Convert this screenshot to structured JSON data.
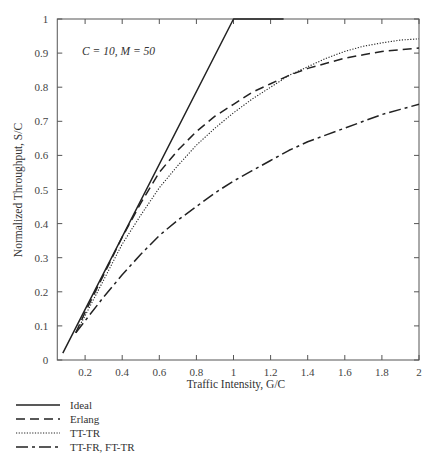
{
  "chart_data": {
    "type": "line",
    "title": "",
    "annotation": "C = 10, M = 50",
    "xlabel": "Traffic Intensity, G/C",
    "ylabel": "Normalized Throughput, S/C",
    "xlim": [
      0.05,
      2
    ],
    "ylim": [
      0,
      1
    ],
    "xticks": [
      0.2,
      0.4,
      0.6,
      0.8,
      1,
      1.2,
      1.4,
      1.6,
      1.8,
      2
    ],
    "xtick_labels": [
      "0.2",
      "0.4",
      "0.6",
      "0.8",
      "1",
      "1.2",
      "1.4",
      "1.6",
      "1.8",
      "2"
    ],
    "yticks": [
      0,
      0.1,
      0.2,
      0.3,
      0.4,
      0.5,
      0.6,
      0.7,
      0.8,
      0.9,
      1
    ],
    "ytick_labels": [
      "0",
      "0.1",
      "0.2",
      "0.3",
      "0.4",
      "0.5",
      "0.6",
      "0.7",
      "0.8",
      "0.9",
      "1"
    ],
    "grid": false,
    "legend_position": "below-left",
    "series": [
      {
        "name": "Ideal",
        "style": "solid",
        "x": [
          0.08,
          1.0,
          1.27
        ],
        "y": [
          0.02,
          1.0,
          1.0
        ]
      },
      {
        "name": "Erlang",
        "style": "dashed",
        "x": [
          0.15,
          0.2,
          0.3,
          0.4,
          0.5,
          0.6,
          0.7,
          0.8,
          0.9,
          1.0,
          1.1,
          1.2,
          1.3,
          1.4,
          1.5,
          1.6,
          1.7,
          1.8,
          1.9,
          2.0
        ],
        "y": [
          0.08,
          0.14,
          0.25,
          0.36,
          0.46,
          0.55,
          0.615,
          0.67,
          0.715,
          0.75,
          0.785,
          0.81,
          0.835,
          0.855,
          0.87,
          0.885,
          0.895,
          0.905,
          0.91,
          0.915
        ]
      },
      {
        "name": "TT-TR",
        "style": "dotted",
        "x": [
          0.15,
          0.2,
          0.3,
          0.4,
          0.5,
          0.6,
          0.7,
          0.8,
          0.9,
          1.0,
          1.1,
          1.2,
          1.3,
          1.4,
          1.5,
          1.6,
          1.7,
          1.8,
          1.9,
          2.0
        ],
        "y": [
          0.08,
          0.13,
          0.235,
          0.34,
          0.425,
          0.505,
          0.57,
          0.63,
          0.68,
          0.725,
          0.765,
          0.8,
          0.835,
          0.86,
          0.885,
          0.905,
          0.92,
          0.93,
          0.938,
          0.942
        ]
      },
      {
        "name": "TT-FR, FT-TR",
        "style": "dashdot",
        "x": [
          0.15,
          0.2,
          0.3,
          0.4,
          0.5,
          0.6,
          0.7,
          0.8,
          0.9,
          1.0,
          1.1,
          1.2,
          1.3,
          1.4,
          1.5,
          1.6,
          1.7,
          1.8,
          1.9,
          2.0
        ],
        "y": [
          0.08,
          0.115,
          0.185,
          0.25,
          0.31,
          0.365,
          0.41,
          0.45,
          0.49,
          0.525,
          0.555,
          0.585,
          0.615,
          0.64,
          0.66,
          0.68,
          0.7,
          0.72,
          0.735,
          0.75
        ]
      }
    ]
  },
  "legend": {
    "items": [
      {
        "label": "Ideal",
        "style": "solid"
      },
      {
        "label": "Erlang",
        "style": "dashed"
      },
      {
        "label": "TT-TR",
        "style": "dotted"
      },
      {
        "label": "TT-FR, FT-TR",
        "style": "dashdot"
      }
    ]
  },
  "colors": {
    "line": "#222222",
    "axis": "#555555",
    "text": "#333333"
  }
}
